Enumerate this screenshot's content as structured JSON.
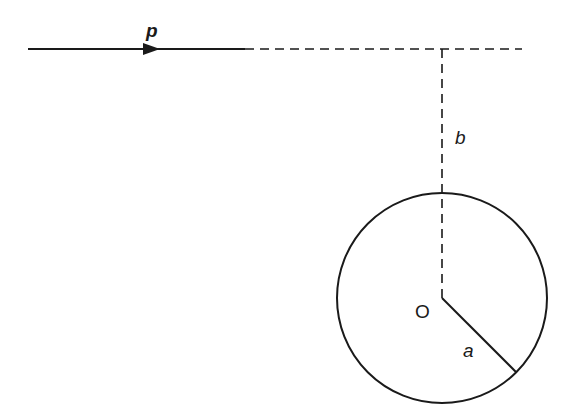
{
  "figure": {
    "type": "scattering-geometry"
  },
  "labels": {
    "momentum": "p",
    "impact_parameter": "b",
    "origin": "O",
    "radius": "a"
  },
  "geometry": {
    "incident_line": {
      "x1": 28,
      "y1": 49,
      "x2": 245,
      "y2": 49
    },
    "arrow_tip": {
      "x": 160,
      "y": 49
    },
    "extension_dashed": {
      "x1": 245,
      "y1": 49,
      "x2": 522,
      "y2": 49
    },
    "impact_dashed": {
      "x1": 442,
      "y1": 49,
      "x2": 442,
      "y2": 298
    },
    "circle": {
      "cx": 442,
      "cy": 298,
      "r": 105
    },
    "radius_line": {
      "x1": 442,
      "y1": 298,
      "x2": 516,
      "y2": 372
    }
  },
  "colors": {
    "ink": "#1a1a1a",
    "background": "#ffffff"
  }
}
